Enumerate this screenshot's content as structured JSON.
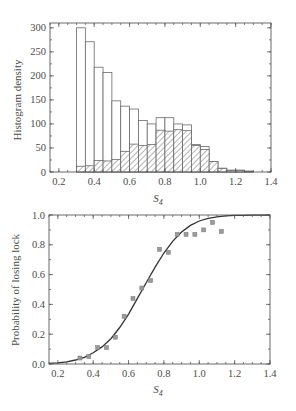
{
  "chart_data": [
    {
      "type": "bar",
      "title": "",
      "xlabel": "S",
      "xlabel_subscript": "4",
      "ylabel": "Histogram density",
      "xlim": [
        0.15,
        1.4
      ],
      "ylim": [
        0,
        310
      ],
      "xticks": [
        0.2,
        0.4,
        0.6,
        0.8,
        1.0,
        1.2,
        1.4
      ],
      "xtick_labels": [
        "0.2",
        "0.4",
        "0.6",
        "0.8",
        "1.0",
        "1.2",
        "1.4"
      ],
      "yticks": [
        0,
        50,
        100,
        150,
        200,
        250,
        300
      ],
      "ytick_labels": [
        "0",
        "50",
        "100",
        "150",
        "200",
        "250",
        "300"
      ],
      "bin_start": 0.3,
      "bin_width": 0.05,
      "categories": [
        "0.30",
        "0.35",
        "0.40",
        "0.45",
        "0.50",
        "0.55",
        "0.60",
        "0.65",
        "0.70",
        "0.75",
        "0.80",
        "0.85",
        "0.90",
        "0.95",
        "1.00",
        "1.05",
        "1.10",
        "1.15",
        "1.20",
        "1.25"
      ],
      "series": [
        {
          "name": "All samples (open bars)",
          "style": "open",
          "values": [
            300,
            271,
            218,
            207,
            148,
            137,
            131,
            107,
            100,
            113,
            113,
            100,
            98,
            57,
            53,
            22,
            8,
            4,
            4,
            2
          ]
        },
        {
          "name": "Loss of lock (hatched bars)",
          "style": "hatched",
          "values": [
            12,
            13,
            24,
            23,
            26,
            43,
            58,
            55,
            57,
            87,
            85,
            88,
            86,
            55,
            47,
            22,
            7,
            3,
            3,
            1
          ]
        }
      ],
      "grid": false,
      "legend": "none"
    },
    {
      "type": "scatter",
      "title": "",
      "xlabel": "S",
      "xlabel_subscript": "4",
      "ylabel": "Probability of losing lock",
      "xlim": [
        0.15,
        1.4
      ],
      "ylim": [
        0,
        1.0
      ],
      "xticks": [
        0.2,
        0.4,
        0.6,
        0.8,
        1.0,
        1.2,
        1.4
      ],
      "xtick_labels": [
        "0.2",
        "0.4",
        "0.6",
        "0.8",
        "1.0",
        "1.2",
        "1.4"
      ],
      "yticks": [
        0.0,
        0.2,
        0.4,
        0.6,
        0.8,
        1.0
      ],
      "ytick_labels": [
        "0.0",
        "0.2",
        "0.4",
        "0.6",
        "0.8",
        "1.0"
      ],
      "series": [
        {
          "name": "Observed",
          "style": "markers",
          "x": [
            0.325,
            0.375,
            0.425,
            0.475,
            0.525,
            0.575,
            0.625,
            0.675,
            0.725,
            0.775,
            0.825,
            0.875,
            0.925,
            0.975,
            1.025,
            1.075,
            1.125
          ],
          "y": [
            0.04,
            0.05,
            0.11,
            0.11,
            0.18,
            0.32,
            0.44,
            0.51,
            0.56,
            0.77,
            0.75,
            0.87,
            0.87,
            0.87,
            0.9,
            0.95,
            0.89
          ]
        },
        {
          "name": "Fitted curve",
          "style": "line",
          "x": [
            0.15,
            0.2,
            0.25,
            0.3,
            0.35,
            0.4,
            0.45,
            0.5,
            0.55,
            0.6,
            0.65,
            0.7,
            0.75,
            0.8,
            0.85,
            0.9,
            0.95,
            1.0,
            1.05,
            1.1,
            1.15,
            1.2,
            1.25,
            1.3,
            1.35,
            1.4
          ],
          "y": [
            0.005,
            0.008,
            0.015,
            0.027,
            0.045,
            0.075,
            0.115,
            0.17,
            0.245,
            0.335,
            0.44,
            0.545,
            0.65,
            0.745,
            0.825,
            0.885,
            0.93,
            0.96,
            0.978,
            0.988,
            0.994,
            0.997,
            0.998,
            0.999,
            0.999,
            1.0
          ]
        }
      ],
      "grid": false,
      "legend": "none"
    }
  ]
}
